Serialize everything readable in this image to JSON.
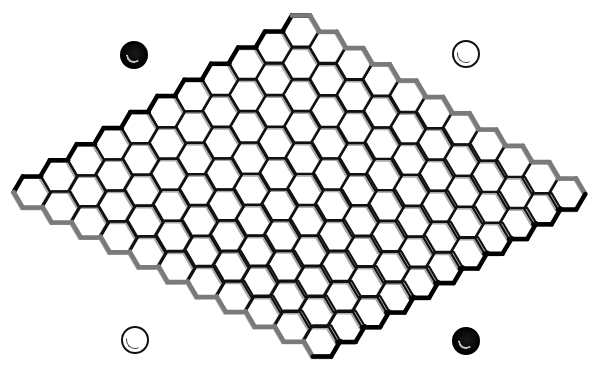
{
  "game": {
    "name": "Hex",
    "board_size": 11,
    "corners": {
      "top": [
        301,
        31
      ],
      "right": [
        567,
        194
      ],
      "left": [
        32,
        192
      ],
      "bottom": [
        322,
        341
      ]
    },
    "hex": {
      "radius": 18.3,
      "half_height": 15.6
    },
    "edges": {
      "top_left": "#000000",
      "top_right": "#7a7a7a",
      "bottom_left": "#7a7a7a",
      "bottom_right": "#000000"
    },
    "colors": {
      "grid_line": "#111111",
      "grid_shadow": "#a8a8a8",
      "background": "#ffffff"
    },
    "placed_stones": []
  },
  "corner_stones": [
    {
      "id": "top-left",
      "color": "black",
      "cx": 134,
      "cy": 55,
      "r": 14
    },
    {
      "id": "top-right",
      "color": "white",
      "cx": 466,
      "cy": 54,
      "r": 14
    },
    {
      "id": "bottom-left",
      "color": "white",
      "cx": 135,
      "cy": 340,
      "r": 14
    },
    {
      "id": "bottom-right",
      "color": "black",
      "cx": 466,
      "cy": 341,
      "r": 14
    }
  ]
}
